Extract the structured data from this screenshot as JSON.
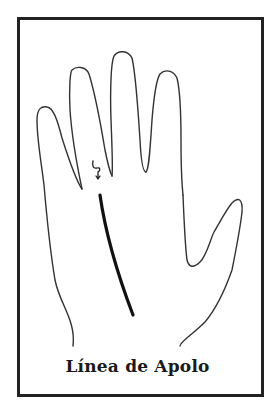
{
  "figure": {
    "caption": "Línea de Apolo",
    "highlighted_line": "apollo-line",
    "symbol_near_finger": "apollo-symbol",
    "colors": {
      "border": "#222222",
      "outline": "#333333",
      "line": "#111111",
      "background": "#ffffff",
      "caption": "#1a1a1a"
    }
  }
}
